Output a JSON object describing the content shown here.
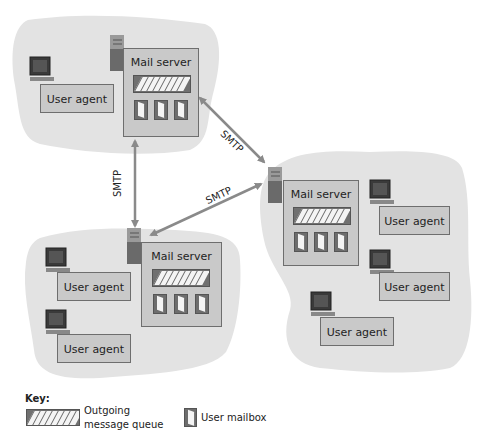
{
  "diagram": {
    "labels": {
      "mail_server": "Mail server",
      "user_agent": "User agent",
      "smtp": "SMTP"
    },
    "domains": [
      {
        "id": "top-left",
        "mail_server": {
          "label": "Mail server"
        },
        "user_agents": [
          {
            "label": "User agent"
          }
        ]
      },
      {
        "id": "right",
        "mail_server": {
          "label": "Mail server"
        },
        "user_agents": [
          {
            "label": "User agent"
          },
          {
            "label": "User agent"
          },
          {
            "label": "User agent"
          }
        ]
      },
      {
        "id": "bottom-left",
        "mail_server": {
          "label": "Mail server"
        },
        "user_agents": [
          {
            "label": "User agent"
          },
          {
            "label": "User agent"
          }
        ]
      }
    ],
    "links": [
      {
        "from": "top-left",
        "to": "right",
        "label": "SMTP"
      },
      {
        "from": "top-left",
        "to": "bottom-left",
        "label": "SMTP"
      },
      {
        "from": "bottom-left",
        "to": "right",
        "label": "SMTP"
      }
    ],
    "key": {
      "title": "Key:",
      "queue_line1": "Outgoing",
      "queue_line2": "message queue",
      "mailbox": "User mailbox"
    },
    "colors": {
      "cloud": "#e3e3e3",
      "box_fill": "#c9c9c9",
      "box_border": "#6e6e6e",
      "arrow": "#8a8a8a"
    }
  }
}
